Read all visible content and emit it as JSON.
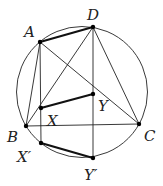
{
  "diagram": {
    "type": "geometry",
    "circle": {
      "cx": 82,
      "cy": 92,
      "r": 65.5
    },
    "points": {
      "A": {
        "x": 40,
        "y": 42,
        "label": "A",
        "lx": 24,
        "ly": 37
      },
      "D": {
        "x": 93,
        "y": 27,
        "label": "D",
        "lx": 87,
        "ly": 20
      },
      "B": {
        "x": 26,
        "y": 126,
        "label": "B",
        "lx": 7,
        "ly": 142
      },
      "C": {
        "x": 139,
        "y": 124,
        "label": "C",
        "lx": 144,
        "ly": 141
      },
      "X": {
        "x": 41,
        "y": 108,
        "label": "X",
        "lx": 47,
        "ly": 126
      },
      "Y": {
        "x": 93,
        "y": 94,
        "label": "Y",
        "lx": 98,
        "ly": 111
      },
      "X'": {
        "x": 41,
        "y": 143,
        "label": "X′",
        "lx": 17,
        "ly": 162
      },
      "Y'": {
        "x": 93,
        "y": 158,
        "label": "Y′",
        "lx": 84,
        "ly": 180
      }
    },
    "thin_segments": [
      [
        "A",
        "B"
      ],
      [
        "A",
        "X'"
      ],
      [
        "A",
        "C"
      ],
      [
        "D",
        "B"
      ],
      [
        "D",
        "Y'"
      ],
      [
        "D",
        "C"
      ],
      [
        "B",
        "C"
      ]
    ],
    "bold_segments": [
      [
        "A",
        "D"
      ],
      [
        "X",
        "Y"
      ],
      [
        "X'",
        "Y'"
      ]
    ]
  }
}
